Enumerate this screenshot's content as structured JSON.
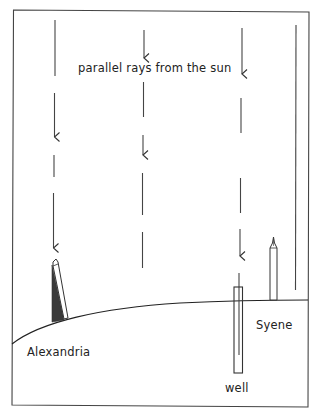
{
  "diagram": {
    "colors": {
      "line": "#333333",
      "shadow": "#3a3a3a",
      "background": "#ffffff"
    },
    "labels": {
      "rays": "parallel rays from the sun",
      "alexandria": "Alexandria",
      "well": "well",
      "syene": "Syene"
    },
    "elements": {
      "border": "frame",
      "earth_surface": "curved-ground-line",
      "rays": [
        {
          "name": "ray-column-alexandria",
          "x": 54
        },
        {
          "name": "ray-column-middle",
          "x": 143
        },
        {
          "name": "ray-column-well",
          "x": 240
        },
        {
          "name": "ray-column-syene",
          "x": 296
        }
      ],
      "alexandria_obelisk": "obelisk with shadow",
      "well": "deep well at Syene",
      "syene_obelisk": "obelisk with no shadow"
    }
  }
}
